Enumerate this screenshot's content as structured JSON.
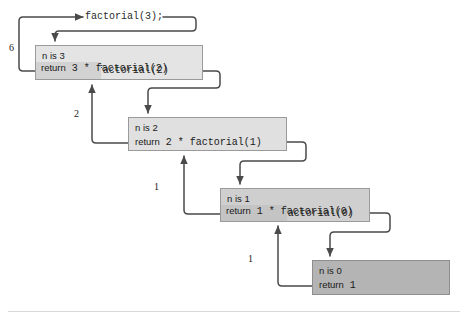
{
  "diagram": {
    "title_call": "factorial(3);",
    "type": "recursion-trace",
    "frames": [
      {
        "id": "frame-n3",
        "n_label": "n is 3",
        "return_keyword": "return",
        "return_expr": "3  *  factorial(2)",
        "return_operand": "3  *",
        "return_call": "factorial(2)",
        "fill": "#e4e4e4",
        "accent_fill": "#d2d2d2",
        "x": 35,
        "y": 45,
        "w": 168,
        "h": 35
      },
      {
        "id": "frame-n2",
        "n_label": "n is 2",
        "return_keyword": "return",
        "return_expr": "2  *  factorial(1)",
        "return_operand": "2  *",
        "return_call": "factorial(1)",
        "fill": "#e0e0e0",
        "accent_fill": "#e0e0e0",
        "x": 128,
        "y": 117,
        "w": 159,
        "h": 34
      },
      {
        "id": "frame-n1",
        "n_label": "n is 1",
        "return_keyword": "return",
        "return_expr": "1  *  factorial(0)",
        "return_operand": "1  *",
        "return_call": "factorial(0)",
        "fill": "#cfcfcf",
        "accent_fill": "#c4c4c4",
        "x": 220,
        "y": 188,
        "w": 150,
        "h": 34
      },
      {
        "id": "frame-n0",
        "n_label": "n is 0",
        "return_keyword": "return",
        "return_expr": "1",
        "return_operand": "1",
        "return_call": "",
        "fill": "#b4b4b4",
        "accent_fill": "#b4b4b4",
        "x": 312,
        "y": 260,
        "w": 138,
        "h": 35
      }
    ],
    "return_values": [
      {
        "id": "ret-6",
        "label": "6",
        "x": 9,
        "y": 42
      },
      {
        "id": "ret-2",
        "label": "2",
        "x": 74,
        "y": 108
      },
      {
        "id": "ret-1a",
        "label": "1",
        "x": 154,
        "y": 181
      },
      {
        "id": "ret-1b",
        "label": "1",
        "x": 248,
        "y": 253
      }
    ],
    "colors": {
      "wire": "#4a4a4a",
      "frame_border": "#9a9a9a",
      "text": "#1a1a1a",
      "rule": "#d8d8d8",
      "background": "#ffffff"
    }
  }
}
